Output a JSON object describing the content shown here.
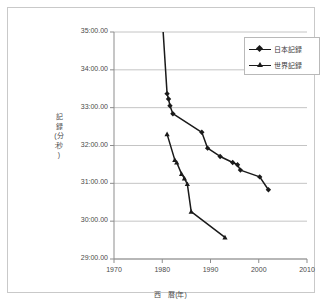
{
  "chart_data": {
    "type": "line",
    "title": "",
    "xlabel": "西　暦(年)",
    "ylabel_lines": [
      "記",
      "録",
      "(分",
      ":秒",
      ")"
    ],
    "ylabel": "記 録(分:秒)",
    "xlim": [
      1970,
      2010
    ],
    "ylim": [
      29,
      35
    ],
    "xticks": [
      1970,
      1980,
      1990,
      2000,
      2010
    ],
    "xticklabels": [
      "1970",
      "1980",
      "1990",
      "2000",
      "2010"
    ],
    "yticks": [
      29,
      30,
      31,
      32,
      33,
      34,
      35
    ],
    "yticklabels": [
      "29:00.00",
      "30:00.00",
      "31:00.00",
      "32:00.00",
      "33:00.00",
      "34:00.00",
      "35:00.00"
    ],
    "grid": "horizontal",
    "legend_position": "top-right",
    "series": [
      {
        "name": "日本記録",
        "marker": "square",
        "color": "#1a1a1a",
        "points": [
          [
            1980.0,
            35.38
          ],
          [
            1981.0,
            33.37
          ],
          [
            1981.3,
            33.23
          ],
          [
            1981.6,
            33.05
          ],
          [
            1982.2,
            32.84
          ],
          [
            1988.2,
            32.35
          ],
          [
            1989.4,
            31.93
          ],
          [
            1992.0,
            31.71
          ],
          [
            1994.6,
            31.55
          ],
          [
            1995.6,
            31.49
          ],
          [
            1996.2,
            31.35
          ],
          [
            2000.2,
            31.17
          ],
          [
            2002.0,
            30.83
          ]
        ]
      },
      {
        "name": "世界記録",
        "marker": "triangle",
        "color": "#1a1a1a",
        "points": [
          [
            1981.0,
            32.3
          ],
          [
            1982.6,
            31.62
          ],
          [
            1983.0,
            31.55
          ],
          [
            1984.0,
            31.25
          ],
          [
            1984.6,
            31.13
          ],
          [
            1985.2,
            30.98
          ],
          [
            1986.0,
            30.25
          ],
          [
            1993.0,
            29.57
          ]
        ]
      }
    ]
  },
  "legend": {
    "items": [
      {
        "label": "日本記録"
      },
      {
        "label": "世界記録"
      }
    ]
  }
}
